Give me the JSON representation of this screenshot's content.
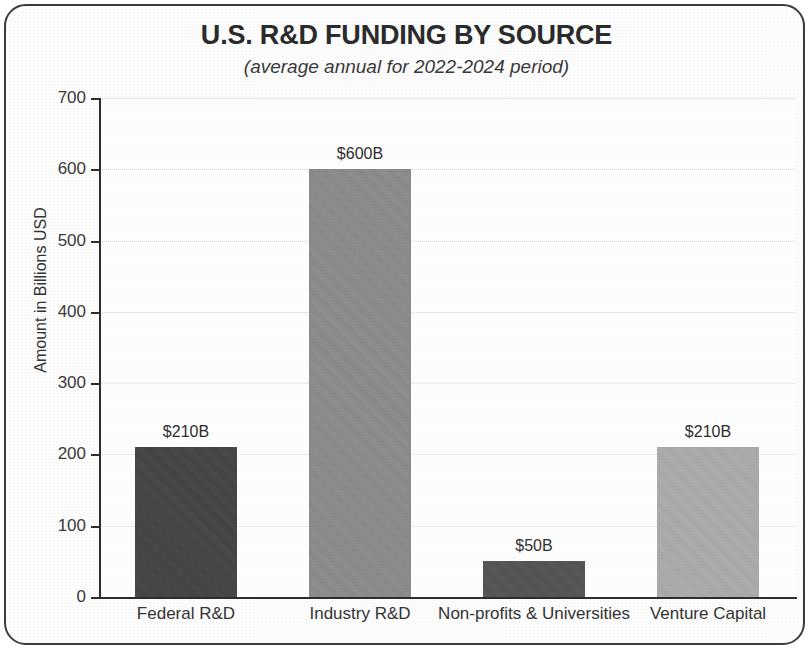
{
  "chart_data": {
    "type": "bar",
    "title": "U.S. R&D FUNDING BY SOURCE",
    "subtitle": "(average annual for 2022-2024 period)",
    "xlabel": "",
    "ylabel": "Amount in Billions USD",
    "ylim": [
      0,
      700
    ],
    "yticks": [
      0,
      100,
      200,
      300,
      400,
      500,
      600,
      700
    ],
    "ytick_labels": [
      "0",
      "100",
      "200",
      "300",
      "400",
      "500",
      "600",
      "700"
    ],
    "grid": true,
    "legend": "none",
    "categories": [
      "Federal R&D",
      "Industry R&D",
      "Non-profits & Universities",
      "Venture Capital"
    ],
    "values": [
      210,
      600,
      50,
      210
    ],
    "data_labels": [
      "$210B",
      "$600B",
      "$50B",
      "$210B"
    ],
    "bar_colors": [
      "#454545",
      "#8c8c8c",
      "#545454",
      "#acacac"
    ],
    "units": "Billions USD"
  },
  "style": {
    "border_color": "#3c3c3c",
    "axis_color": "#2e2e2e",
    "grid_color": "#d8d8d8",
    "background": "#fdfdfd",
    "text_color": "#2b2b2b"
  }
}
